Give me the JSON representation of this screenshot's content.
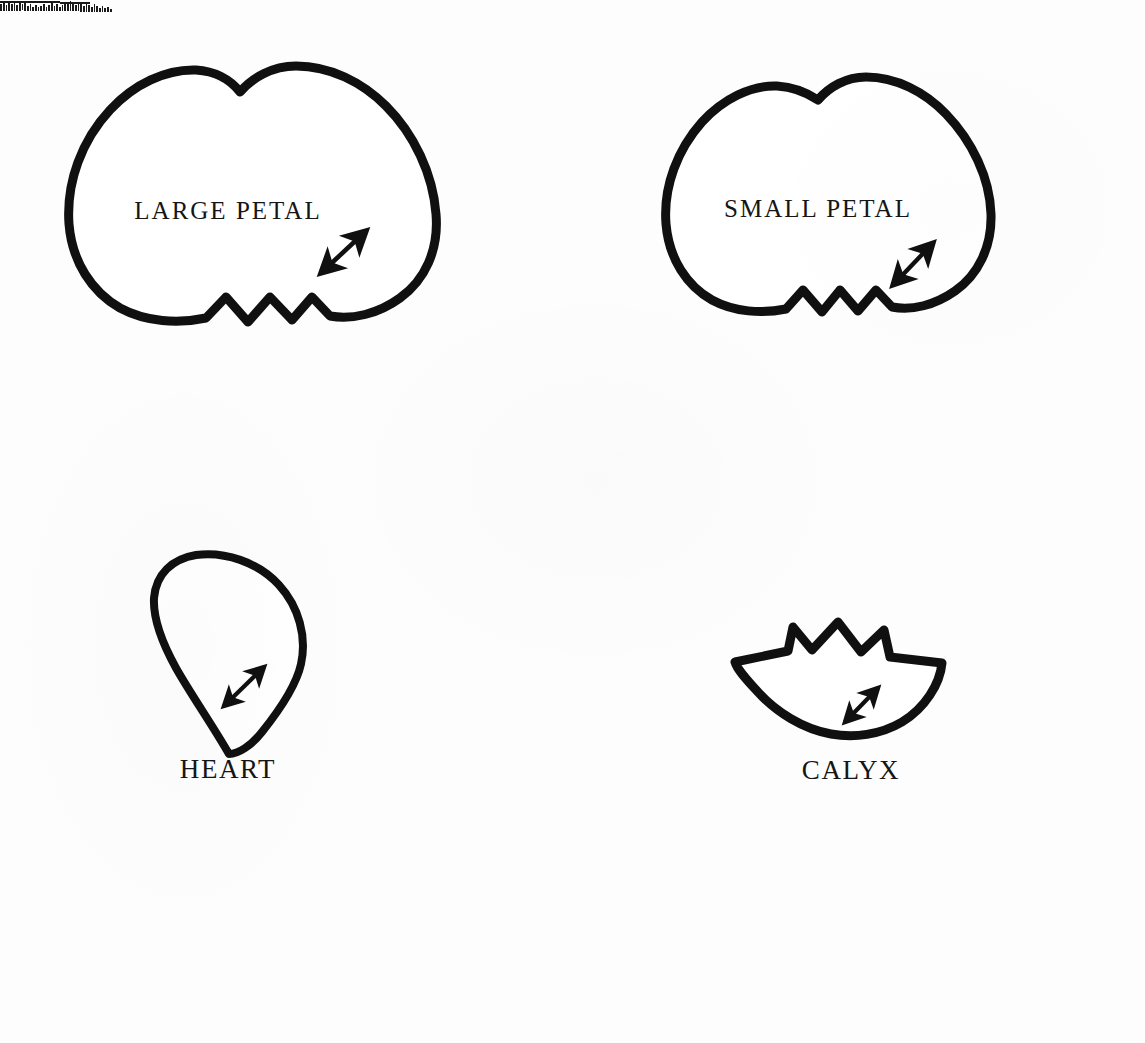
{
  "page": {
    "kind": "scanned-pattern-sheet",
    "background_color": "#fdfdfd",
    "ink_color": "#101010",
    "width": 1145,
    "height": 1043
  },
  "artifact": {
    "name": "scan-edge-artifact",
    "description": "dark striped scanner edge mark at top-left corner",
    "x": 0,
    "y": 0,
    "width": 112,
    "height": 13
  },
  "templates": [
    {
      "id": "large-petal",
      "label": "LARGE PETAL",
      "label_position": "inside",
      "label_x": 228,
      "label_y": 211,
      "bounds": {
        "x": 66,
        "y": 62,
        "width": 372,
        "height": 272
      },
      "stroke_width": 9,
      "grain_arrow": {
        "name": "grain-direction-arrow",
        "type": "double-headed",
        "x1": 321,
        "y1": 273,
        "x2": 366,
        "y2": 231
      }
    },
    {
      "id": "small-petal",
      "label": "SMALL PETAL",
      "label_position": "inside",
      "label_x": 818,
      "label_y": 209,
      "bounds": {
        "x": 648,
        "y": 75,
        "width": 345,
        "height": 254
      },
      "stroke_width": 9,
      "grain_arrow": {
        "name": "grain-direction-arrow",
        "type": "double-headed",
        "x1": 893,
        "y1": 285,
        "x2": 933,
        "y2": 243
      }
    },
    {
      "id": "heart",
      "label": "HEART",
      "label_position": "below",
      "label_x": 228,
      "label_y": 769,
      "bounds": {
        "x": 152,
        "y": 554,
        "width": 155,
        "height": 200
      },
      "stroke_width": 8,
      "grain_arrow": {
        "name": "grain-direction-arrow",
        "type": "double-headed",
        "x1": 224,
        "y1": 706,
        "x2": 264,
        "y2": 667
      }
    },
    {
      "id": "calyx",
      "label": "CALYX",
      "label_position": "below",
      "label_x": 851,
      "label_y": 770,
      "bounds": {
        "x": 731,
        "y": 620,
        "width": 215,
        "height": 113
      },
      "stroke_width": 9,
      "spike_count": 5,
      "grain_arrow": {
        "name": "grain-direction-arrow",
        "type": "double-headed",
        "x1": 845,
        "y1": 722,
        "x2": 878,
        "y2": 688
      }
    }
  ]
}
